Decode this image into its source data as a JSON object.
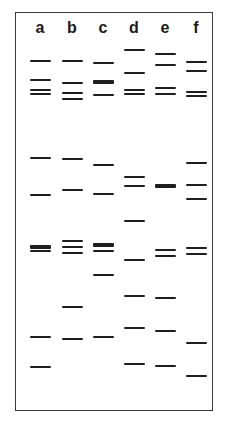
{
  "figure": {
    "type": "gel-electrophoresis",
    "frame_color": "#3a3a3a",
    "band_color": "#1e1e1e",
    "lanes": [
      {
        "label": "a",
        "x": 40,
        "bands": [
          {
            "y": 61
          },
          {
            "y": 80
          },
          {
            "y": 90
          },
          {
            "y": 94
          },
          {
            "y": 158
          },
          {
            "y": 195
          },
          {
            "y": 247,
            "thick": true
          },
          {
            "y": 251
          },
          {
            "y": 337
          },
          {
            "y": 367
          }
        ]
      },
      {
        "label": "b",
        "x": 72,
        "bands": [
          {
            "y": 61
          },
          {
            "y": 83
          },
          {
            "y": 93
          },
          {
            "y": 99
          },
          {
            "y": 159
          },
          {
            "y": 190
          },
          {
            "y": 241
          },
          {
            "y": 247
          },
          {
            "y": 253
          },
          {
            "y": 307
          },
          {
            "y": 339
          }
        ]
      },
      {
        "label": "c",
        "x": 103,
        "bands": [
          {
            "y": 63
          },
          {
            "y": 82,
            "thick": true
          },
          {
            "y": 95
          },
          {
            "y": 165
          },
          {
            "y": 194
          },
          {
            "y": 245,
            "thick": true
          },
          {
            "y": 251
          },
          {
            "y": 275
          },
          {
            "y": 337
          }
        ]
      },
      {
        "label": "d",
        "x": 134,
        "bands": [
          {
            "y": 50
          },
          {
            "y": 73
          },
          {
            "y": 90
          },
          {
            "y": 94
          },
          {
            "y": 177
          },
          {
            "y": 186
          },
          {
            "y": 221
          },
          {
            "y": 260
          },
          {
            "y": 296
          },
          {
            "y": 328
          },
          {
            "y": 364
          }
        ]
      },
      {
        "label": "e",
        "x": 165,
        "bands": [
          {
            "y": 54
          },
          {
            "y": 65
          },
          {
            "y": 88
          },
          {
            "y": 94
          },
          {
            "y": 186,
            "thick": true
          },
          {
            "y": 250
          },
          {
            "y": 256
          },
          {
            "y": 298
          },
          {
            "y": 331
          },
          {
            "y": 366
          }
        ]
      },
      {
        "label": "f",
        "x": 196,
        "bands": [
          {
            "y": 62
          },
          {
            "y": 71
          },
          {
            "y": 92
          },
          {
            "y": 96
          },
          {
            "y": 163
          },
          {
            "y": 185
          },
          {
            "y": 199
          },
          {
            "y": 248
          },
          {
            "y": 254
          },
          {
            "y": 343
          },
          {
            "y": 376
          }
        ]
      }
    ]
  }
}
